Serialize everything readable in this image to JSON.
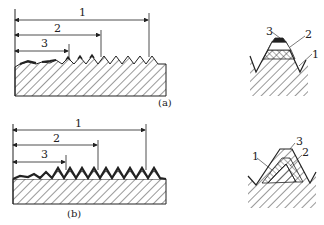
{
  "figure": {
    "panels": [
      {
        "id": "a",
        "caption": "(a)",
        "dimension_labels": [
          "1",
          "2",
          "3"
        ],
        "detail_labels": [
          "3",
          "2",
          "1"
        ]
      },
      {
        "id": "b",
        "caption": "(b)",
        "dimension_labels": [
          "1",
          "2",
          "3"
        ],
        "detail_labels": [
          "1",
          "3",
          "2"
        ]
      }
    ]
  },
  "colors": {
    "line": "#222222",
    "background": "#ffffff"
  }
}
